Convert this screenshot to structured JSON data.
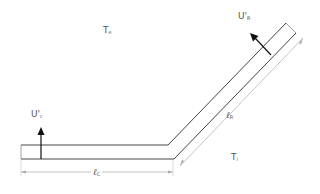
{
  "diagram": {
    "labels": {
      "te": {
        "main": "T",
        "sub": "e"
      },
      "ti": {
        "main": "T",
        "sub": "i"
      },
      "uc": {
        "main": "U'",
        "sub": "c"
      },
      "ur": {
        "main": "U'",
        "sub": "R"
      },
      "lc": {
        "main": "ℓ",
        "sub": "C"
      },
      "lr": {
        "main": "ℓ",
        "sub": "R"
      }
    },
    "colors": {
      "wall": "#444444",
      "dimension": "#aaaaaa",
      "arrow": "#111111",
      "text": "#555555"
    }
  }
}
